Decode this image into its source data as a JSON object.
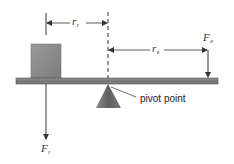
{
  "diagram": {
    "colors": {
      "background": "#ffffff",
      "beam": "#7a7a7a",
      "beam_edge": "#4e4e4e",
      "block": "#8c8c8c",
      "pivot": "#6e6e6e",
      "lines": "#333333"
    },
    "labels": {
      "resistance_arm": {
        "symbol": "r",
        "subscript": "r"
      },
      "effort_arm": {
        "symbol": "r",
        "subscript": "e"
      },
      "effort_force": {
        "symbol": "F",
        "subscript": "e"
      },
      "resistance_force": {
        "symbol": "F",
        "subscript": "r"
      },
      "pivot_point": "pivot point"
    },
    "elements": [
      {
        "name": "beam",
        "type": "rect"
      },
      {
        "name": "load-block",
        "type": "rect"
      },
      {
        "name": "pivot-triangle",
        "type": "triangle"
      },
      {
        "name": "pivot-dashed-line",
        "type": "dashed-line"
      },
      {
        "name": "resistance-arm-dimension",
        "type": "dimension-arrow"
      },
      {
        "name": "effort-arm-dimension",
        "type": "dimension-arrow"
      },
      {
        "name": "effort-force-arrow",
        "type": "arrow",
        "direction": "down"
      },
      {
        "name": "resistance-force-arrow",
        "type": "arrow",
        "direction": "down"
      }
    ]
  }
}
